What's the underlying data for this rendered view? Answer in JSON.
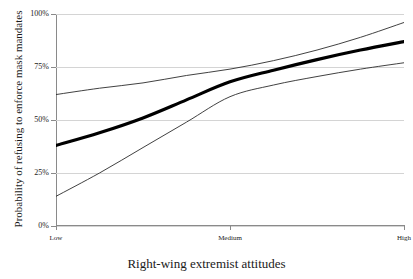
{
  "chart_data": {
    "type": "line",
    "title": "",
    "xlabel": "Right-wing extremist attitudes",
    "ylabel": "Probability of refusing to enforce mask mandates",
    "x_tick_labels": [
      "Low",
      "Medium",
      "High"
    ],
    "x_tick_positions": [
      0,
      0.5,
      1
    ],
    "y_tick_labels": [
      "0%",
      "25%",
      "50%",
      "75%",
      "100%"
    ],
    "y_tick_values": [
      0,
      25,
      50,
      75,
      100
    ],
    "ylim": [
      0,
      100
    ],
    "xlim": [
      0,
      1
    ],
    "grid": "horizontal",
    "legend": "none",
    "series": [
      {
        "name": "upper-confidence-bound",
        "style": "thin",
        "color": "#2b2b2b",
        "x": [
          0,
          0.125,
          0.25,
          0.375,
          0.5,
          0.625,
          0.75,
          0.875,
          1
        ],
        "values": [
          62,
          65,
          67.5,
          71,
          74,
          78,
          83,
          89,
          96
        ]
      },
      {
        "name": "predicted-probability",
        "style": "thick",
        "color": "#000000",
        "x": [
          0,
          0.125,
          0.25,
          0.375,
          0.5,
          0.625,
          0.75,
          0.875,
          1
        ],
        "values": [
          38,
          44,
          51,
          59.5,
          68,
          73.5,
          78.5,
          83,
          87
        ]
      },
      {
        "name": "lower-confidence-bound",
        "style": "thin",
        "color": "#2b2b2b",
        "x": [
          0,
          0.125,
          0.25,
          0.375,
          0.5,
          0.625,
          0.75,
          0.875,
          1
        ],
        "values": [
          14,
          25,
          37,
          49,
          61,
          66.5,
          70.5,
          74,
          77
        ]
      }
    ]
  }
}
